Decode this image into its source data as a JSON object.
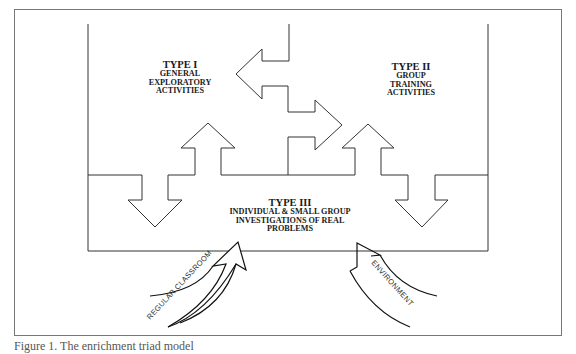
{
  "diagram": {
    "type_i": {
      "title": "TYPE I",
      "lines": [
        "GENERAL",
        "EXPLORATORY",
        "ACTIVITIES"
      ]
    },
    "type_ii": {
      "title": "TYPE II",
      "lines": [
        "GROUP",
        "TRAINING",
        "ACTIVITIES"
      ]
    },
    "type_iii": {
      "title": "TYPE III",
      "lines": [
        "INDIVIDUAL & SMALL GROUP",
        "INVESTIGATIONS OF REAL",
        "PROBLEMS"
      ]
    },
    "inputs": {
      "left": "REGULAR CLASSROOM",
      "right": "ENVIRONMENT"
    },
    "colors": {
      "line": "#333333",
      "frame": "#777777",
      "background": "#ffffff"
    }
  },
  "caption": "Figure 1. The enrichment triad model"
}
